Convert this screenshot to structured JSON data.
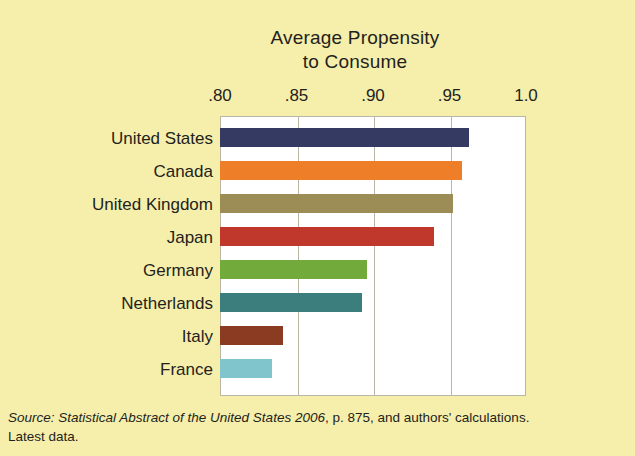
{
  "chart_data": {
    "type": "bar",
    "orientation": "horizontal",
    "title": "Average Propensity to Consume",
    "title_lines": [
      "Average Propensity",
      "to Consume"
    ],
    "xlabel": "",
    "ylabel": "",
    "xlim": [
      0.8,
      1.0
    ],
    "xticks": [
      0.8,
      0.85,
      0.9,
      0.95,
      1.0
    ],
    "xtick_labels": [
      ".80",
      ".85",
      ".90",
      ".95",
      "1.0"
    ],
    "grid": "vertical",
    "legend": "none",
    "categories": [
      "United States",
      "Canada",
      "United Kingdom",
      "Japan",
      "Germany",
      "Netherlands",
      "Italy",
      "France"
    ],
    "values": [
      0.963,
      0.958,
      0.952,
      0.94,
      0.896,
      0.893,
      0.841,
      0.834
    ],
    "bar_colors": [
      "#353a63",
      "#ef7e29",
      "#9b8d55",
      "#c0372b",
      "#72ab3b",
      "#3c7d7d",
      "#8b3b22",
      "#80c4cc"
    ]
  },
  "figure": {
    "background_color": "#f6eeab",
    "plot_background_color": "#ffffff",
    "axis_color": "#b9b6a6",
    "text_color": "#231f1c"
  },
  "source_note": {
    "line1_italic": "Source: Statistical Abstract of the United States 2006",
    "line1_roman": ", p. 875, and authors' calculations.",
    "line2": "Latest data."
  }
}
